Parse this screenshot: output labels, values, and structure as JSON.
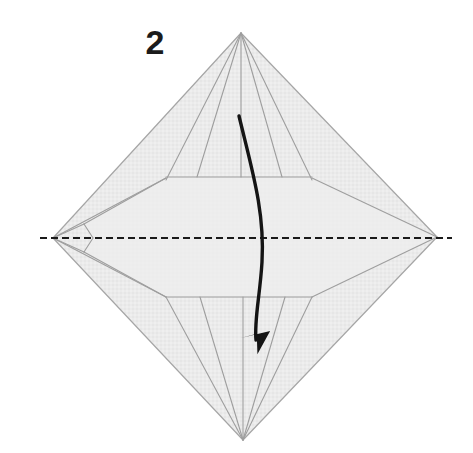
{
  "diagram": {
    "kind": "origami-fold-instruction",
    "step_label": "2",
    "canvas": {
      "width": 473,
      "height": 453
    },
    "colors": {
      "background": "#ffffff",
      "paper_fill": "#ebebeb",
      "paper_fill_light": "#f1f1f1",
      "crease_line": "#9e9e9e",
      "outline": "#a6a6a6",
      "fold_axis_dash": "#1a1a1a",
      "arrow": "#141414",
      "label_text": "#1b1b1b"
    },
    "shape": {
      "name": "diamond-kite-base",
      "vertices": {
        "top": {
          "x": 241,
          "y": 33
        },
        "right": {
          "x": 437,
          "y": 237
        },
        "bottom": {
          "x": 243,
          "y": 440
        },
        "left": {
          "x": 53,
          "y": 238
        }
      },
      "outline_points": "241,33 437,237 243,440 53,238"
    },
    "fold_axis": {
      "name": "horizontal-valley-fold-line",
      "style": "dashed",
      "y": 238,
      "x_start": 40,
      "x_end": 452,
      "dash_length": 7,
      "gap_length": 4,
      "stroke_width": 2
    },
    "arrow": {
      "name": "fold-direction-arrow",
      "description": "curved arrow sweeping downward from upper flap to lower point",
      "path": "M 239 116 C 252 170, 265 212, 262 262 C 260 296, 254 320, 256 340",
      "start": {
        "x": 239,
        "y": 116
      },
      "end": {
        "x": 262,
        "y": 348
      },
      "head_tip": {
        "x": 262,
        "y": 352
      },
      "stroke_width": 3.4
    },
    "crease_lines": [
      {
        "name": "top-to-upper-left-shoulder",
        "d": "M 241 33 L 166 180"
      },
      {
        "name": "top-to-upper-right-shoulder",
        "d": "M 241 33 L 312 180"
      },
      {
        "name": "upper-horizontal-band-top",
        "d": "M 166 177 L 312 177"
      },
      {
        "name": "upper-left-shoulder-to-left-notch",
        "d": "M 166 178 L 84 224"
      },
      {
        "name": "upper-right-shoulder-to-right-point",
        "d": "M 312 178 L 437 237"
      },
      {
        "name": "upper-left-long-edge-to-left-vertex",
        "d": "M 166 178 L 53 238"
      },
      {
        "name": "left-notch-upper-arm",
        "d": "M 84 224 L 93 238"
      },
      {
        "name": "left-notch-lower-arm",
        "d": "M 93 238 L 84 252"
      },
      {
        "name": "lower-left-shoulder-from-notch",
        "d": "M 84 252 L 166 297"
      },
      {
        "name": "lower-horizontal-band-bottom",
        "d": "M 166 297 L 312 297"
      },
      {
        "name": "lower-right-shoulder-to-right-point",
        "d": "M 312 297 L 437 237"
      },
      {
        "name": "lower-left-long-edge-to-left-vertex",
        "d": "M 166 297 L 53 238"
      },
      {
        "name": "bottom-to-lower-left-shoulder",
        "d": "M 243 440 L 166 297"
      },
      {
        "name": "bottom-to-lower-right-shoulder",
        "d": "M 243 440 L 312 297"
      },
      {
        "name": "center-spine-upper",
        "d": "M 241 33 L 241 177"
      },
      {
        "name": "center-spine-lower",
        "d": "M 243 440 L 243 297"
      },
      {
        "name": "upper-inner-left-diagonal",
        "d": "M 241 33 L 197 177"
      },
      {
        "name": "upper-inner-right-diagonal",
        "d": "M 241 33 L 282 177"
      },
      {
        "name": "lower-inner-left-diagonal",
        "d": "M 243 440 L 200 297"
      },
      {
        "name": "lower-inner-right-diagonal",
        "d": "M 243 440 L 285 297"
      },
      {
        "name": "left-upper-mid-crease",
        "d": "M 53 238 L 84 224"
      },
      {
        "name": "left-lower-mid-crease",
        "d": "M 53 238 L 84 252"
      }
    ]
  }
}
